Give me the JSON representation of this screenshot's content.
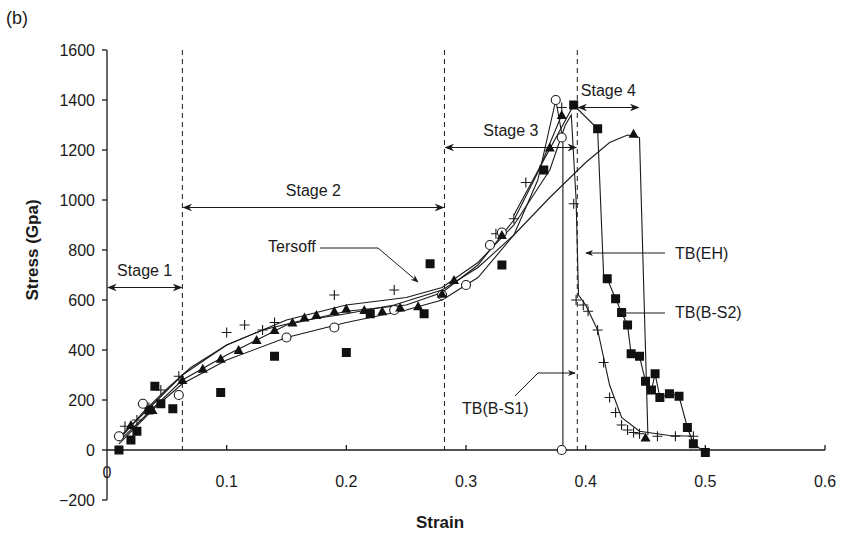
{
  "panel_label": "(b)",
  "chart_data": {
    "type": "line",
    "title": "",
    "xlabel": "Strain",
    "ylabel": "Stress (Gpa)",
    "xlim": [
      0,
      0.6
    ],
    "ylim": [
      -200,
      1600
    ],
    "x_ticks": [
      0,
      0.1,
      0.2,
      0.3,
      0.4,
      0.5,
      0.6
    ],
    "x_tick_labels": [
      "0",
      "0.1",
      "0.2",
      "0.3",
      "0.4",
      "0.5",
      "0.6"
    ],
    "y_ticks": [
      -200,
      0,
      200,
      400,
      600,
      800,
      1000,
      1200,
      1400,
      1600
    ],
    "y_tick_labels": [
      "−200",
      "0",
      "200",
      "400",
      "600",
      "800",
      "1000",
      "1200",
      "1400",
      "1600"
    ],
    "grid": false,
    "legend": "none (inline annotations)",
    "stage_boundaries": [
      0.063,
      0.282,
      0.393
    ],
    "stages": [
      {
        "label": "Stage 1",
        "x_from": 0.0,
        "x_to": 0.063,
        "y": 650
      },
      {
        "label": "Stage 2",
        "x_from": 0.063,
        "x_to": 0.282,
        "y": 970
      },
      {
        "label": "Stage 3",
        "x_from": 0.282,
        "x_to": 0.393,
        "y": 1210
      },
      {
        "label": "Stage 4",
        "x_from": 0.393,
        "x_to": 0.445,
        "y": 1370
      }
    ],
    "annotations": [
      {
        "text": "Tersoff",
        "target": [
          0.26,
          620
        ]
      },
      {
        "text": "TB(EH)",
        "target": [
          0.395,
          780
        ]
      },
      {
        "text": "TB(B-S2)",
        "target": [
          0.427,
          545
        ]
      },
      {
        "text": "TB(B-S1)",
        "target": [
          0.381,
          350
        ]
      }
    ],
    "series": [
      {
        "name": "Tersoff",
        "marker": "none",
        "fit_curve": [
          [
            0.01,
            40
          ],
          [
            0.03,
            150
          ],
          [
            0.05,
            245
          ],
          [
            0.07,
            330
          ],
          [
            0.1,
            420
          ],
          [
            0.13,
            480
          ],
          [
            0.16,
            515
          ],
          [
            0.2,
            545
          ],
          [
            0.24,
            580
          ],
          [
            0.28,
            640
          ],
          [
            0.31,
            730
          ],
          [
            0.34,
            860
          ],
          [
            0.37,
            1010
          ],
          [
            0.4,
            1150
          ],
          [
            0.42,
            1230
          ],
          [
            0.435,
            1260
          ],
          [
            0.445,
            1250
          ]
        ],
        "failure_drop": [
          [
            0.445,
            1250
          ],
          [
            0.452,
            60
          ]
        ]
      },
      {
        "name": "TB(EH)",
        "marker": "plus",
        "points": [
          [
            0.015,
            95
          ],
          [
            0.025,
            120
          ],
          [
            0.035,
            170
          ],
          [
            0.045,
            240
          ],
          [
            0.06,
            295
          ],
          [
            0.1,
            470
          ],
          [
            0.115,
            500
          ],
          [
            0.13,
            480
          ],
          [
            0.14,
            510
          ],
          [
            0.19,
            620
          ],
          [
            0.24,
            640
          ],
          [
            0.325,
            865
          ],
          [
            0.34,
            925
          ],
          [
            0.35,
            1070
          ],
          [
            0.38,
            1370
          ],
          [
            0.39,
            985
          ],
          [
            0.392,
            600
          ],
          [
            0.398,
            580
          ],
          [
            0.402,
            555
          ],
          [
            0.41,
            480
          ],
          [
            0.415,
            350
          ],
          [
            0.42,
            210
          ],
          [
            0.425,
            150
          ],
          [
            0.43,
            100
          ],
          [
            0.435,
            80
          ],
          [
            0.44,
            70
          ],
          [
            0.445,
            65
          ],
          [
            0.46,
            55
          ],
          [
            0.475,
            55
          ],
          [
            0.49,
            55
          ]
        ],
        "fit_curve": [
          [
            0.01,
            50
          ],
          [
            0.04,
            190
          ],
          [
            0.063,
            300
          ],
          [
            0.1,
            420
          ],
          [
            0.15,
            520
          ],
          [
            0.2,
            580
          ],
          [
            0.25,
            610
          ],
          [
            0.28,
            650
          ],
          [
            0.31,
            750
          ],
          [
            0.34,
            900
          ],
          [
            0.37,
            1120
          ],
          [
            0.383,
            1300
          ],
          [
            0.388,
            1340
          ],
          [
            0.392,
            1000
          ],
          [
            0.394,
            620
          ],
          [
            0.4,
            580
          ],
          [
            0.41,
            480
          ],
          [
            0.42,
            260
          ],
          [
            0.43,
            130
          ],
          [
            0.445,
            75
          ],
          [
            0.47,
            58
          ],
          [
            0.49,
            55
          ]
        ]
      },
      {
        "name": "TB(B-S2)",
        "marker": "filled-square",
        "points": [
          [
            0.01,
            0
          ],
          [
            0.02,
            40
          ],
          [
            0.025,
            75
          ],
          [
            0.035,
            160
          ],
          [
            0.04,
            255
          ],
          [
            0.045,
            185
          ],
          [
            0.055,
            165
          ],
          [
            0.095,
            230
          ],
          [
            0.14,
            375
          ],
          [
            0.2,
            390
          ],
          [
            0.22,
            545
          ],
          [
            0.265,
            545
          ],
          [
            0.27,
            745
          ],
          [
            0.33,
            740
          ],
          [
            0.365,
            1120
          ],
          [
            0.39,
            1380
          ],
          [
            0.41,
            1285
          ],
          [
            0.418,
            685
          ],
          [
            0.425,
            605
          ],
          [
            0.43,
            550
          ],
          [
            0.435,
            500
          ],
          [
            0.438,
            385
          ],
          [
            0.445,
            375
          ],
          [
            0.45,
            275
          ],
          [
            0.455,
            240
          ],
          [
            0.458,
            305
          ],
          [
            0.462,
            210
          ],
          [
            0.47,
            225
          ],
          [
            0.478,
            215
          ],
          [
            0.485,
            90
          ],
          [
            0.49,
            25
          ],
          [
            0.5,
            -10
          ]
        ],
        "line_segments": [
          [
            0.34,
            940
          ],
          [
            0.39,
            1380
          ],
          [
            0.41,
            1285
          ],
          [
            0.415,
            700
          ],
          [
            0.418,
            685
          ],
          [
            0.425,
            605
          ],
          [
            0.43,
            550
          ],
          [
            0.435,
            500
          ],
          [
            0.438,
            385
          ],
          [
            0.445,
            375
          ],
          [
            0.45,
            275
          ],
          [
            0.455,
            240
          ],
          [
            0.458,
            305
          ],
          [
            0.462,
            210
          ],
          [
            0.47,
            225
          ],
          [
            0.478,
            215
          ],
          [
            0.485,
            90
          ],
          [
            0.49,
            25
          ],
          [
            0.5,
            -10
          ]
        ]
      },
      {
        "name": "TB(B-S1)",
        "marker": "open-circle",
        "points": [
          [
            0.01,
            55
          ],
          [
            0.03,
            185
          ],
          [
            0.06,
            220
          ],
          [
            0.15,
            450
          ],
          [
            0.19,
            490
          ],
          [
            0.24,
            560
          ],
          [
            0.28,
            620
          ],
          [
            0.3,
            660
          ],
          [
            0.32,
            820
          ],
          [
            0.33,
            870
          ],
          [
            0.375,
            1400
          ],
          [
            0.38,
            1250
          ],
          [
            0.38,
            0
          ]
        ],
        "fit_curve": [
          [
            0.01,
            25
          ],
          [
            0.04,
            170
          ],
          [
            0.063,
            265
          ],
          [
            0.1,
            360
          ],
          [
            0.15,
            450
          ],
          [
            0.2,
            510
          ],
          [
            0.25,
            560
          ],
          [
            0.28,
            600
          ],
          [
            0.31,
            690
          ],
          [
            0.34,
            860
          ],
          [
            0.36,
            1080
          ],
          [
            0.375,
            1400
          ],
          [
            0.381,
            1240
          ],
          [
            0.381,
            0
          ]
        ]
      },
      {
        "name": "Tersoff-triangle",
        "marker": "filled-triangle",
        "points": [
          [
            0.02,
            100
          ],
          [
            0.038,
            160
          ],
          [
            0.063,
            280
          ],
          [
            0.08,
            325
          ],
          [
            0.095,
            365
          ],
          [
            0.11,
            400
          ],
          [
            0.125,
            440
          ],
          [
            0.14,
            480
          ],
          [
            0.155,
            510
          ],
          [
            0.165,
            530
          ],
          [
            0.175,
            540
          ],
          [
            0.19,
            555
          ],
          [
            0.2,
            565
          ],
          [
            0.215,
            560
          ],
          [
            0.23,
            555
          ],
          [
            0.245,
            570
          ],
          [
            0.26,
            575
          ],
          [
            0.28,
            625
          ],
          [
            0.29,
            680
          ],
          [
            0.33,
            860
          ],
          [
            0.37,
            1210
          ],
          [
            0.38,
            1340
          ],
          [
            0.44,
            1265
          ],
          [
            0.45,
            50
          ]
        ],
        "fit_curve": [
          [
            0.01,
            35
          ],
          [
            0.04,
            175
          ],
          [
            0.063,
            280
          ],
          [
            0.1,
            380
          ],
          [
            0.15,
            500
          ],
          [
            0.2,
            555
          ],
          [
            0.25,
            580
          ],
          [
            0.28,
            630
          ],
          [
            0.31,
            740
          ],
          [
            0.34,
            920
          ],
          [
            0.36,
            1110
          ],
          [
            0.38,
            1340
          ]
        ]
      }
    ]
  }
}
